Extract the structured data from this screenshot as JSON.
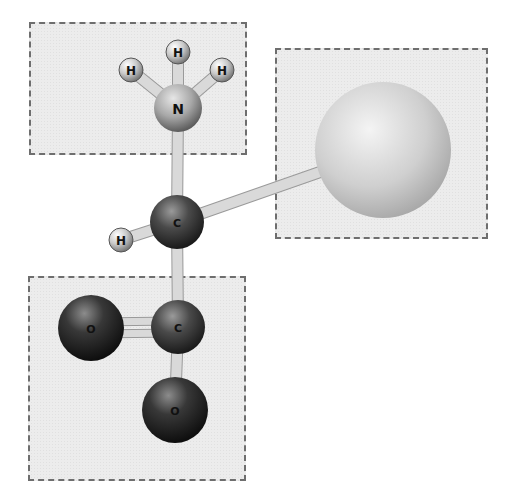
{
  "diagram": {
    "groups": [
      {
        "id": "amino-group",
        "label": "Amino group (NH3+)",
        "x": 29,
        "y": 22,
        "w": 218,
        "h": 133
      },
      {
        "id": "r-group",
        "label": "R group (side chain)",
        "x": 275,
        "y": 48,
        "w": 213,
        "h": 191
      },
      {
        "id": "carboxyl-group",
        "label": "Carboxyl group (COO-)",
        "x": 28,
        "y": 276,
        "w": 218,
        "h": 205
      }
    ],
    "atoms": [
      {
        "id": "h1",
        "element": "H",
        "label": "H",
        "cx": 131,
        "cy": 70,
        "r": 12,
        "color": "light"
      },
      {
        "id": "h2",
        "element": "H",
        "label": "H",
        "cx": 178,
        "cy": 52,
        "r": 12,
        "color": "light"
      },
      {
        "id": "h3",
        "element": "H",
        "label": "H",
        "cx": 222,
        "cy": 70,
        "r": 12,
        "color": "light"
      },
      {
        "id": "n",
        "element": "N",
        "label": "N",
        "cx": 178,
        "cy": 108,
        "r": 24,
        "color": "mid"
      },
      {
        "id": "c-alpha",
        "element": "C",
        "label": "C",
        "cx": 177,
        "cy": 222,
        "r": 27,
        "color": "dark"
      },
      {
        "id": "h-alpha",
        "element": "H",
        "label": "H",
        "cx": 121,
        "cy": 240,
        "r": 12,
        "color": "light"
      },
      {
        "id": "r",
        "element": "R",
        "label": "",
        "cx": 383,
        "cy": 150,
        "r": 68,
        "color": "pale"
      },
      {
        "id": "c-carboxyl",
        "element": "C",
        "label": "C",
        "cx": 178,
        "cy": 327,
        "r": 27,
        "color": "dark"
      },
      {
        "id": "o1",
        "element": "O",
        "label": "O",
        "cx": 91,
        "cy": 328,
        "r": 33,
        "color": "darkest"
      },
      {
        "id": "o2",
        "element": "O",
        "label": "O",
        "cx": 175,
        "cy": 410,
        "r": 33,
        "color": "darkest"
      }
    ],
    "bonds": [
      {
        "from": "n",
        "to": "h1",
        "order": 1
      },
      {
        "from": "n",
        "to": "h2",
        "order": 1
      },
      {
        "from": "n",
        "to": "h3",
        "order": 1
      },
      {
        "from": "n",
        "to": "c-alpha",
        "order": 1
      },
      {
        "from": "c-alpha",
        "to": "h-alpha",
        "order": 1
      },
      {
        "from": "c-alpha",
        "to": "r",
        "order": 1
      },
      {
        "from": "c-alpha",
        "to": "c-carboxyl",
        "order": 1
      },
      {
        "from": "c-carboxyl",
        "to": "o1",
        "order": 2
      },
      {
        "from": "c-carboxyl",
        "to": "o2",
        "order": 1
      }
    ],
    "colors": {
      "box_bg": "#ececec",
      "box_border": "#6e6e6e",
      "bond": "#d9d9d9",
      "bond_edge": "#9a9a9a"
    }
  }
}
